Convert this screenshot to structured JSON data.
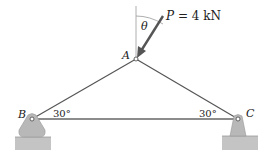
{
  "diagram": {
    "type": "truss",
    "joints": {
      "A": {
        "label": "A",
        "x": 136,
        "y": 59
      },
      "B": {
        "label": "B",
        "x": 32,
        "y": 119
      },
      "C": {
        "label": "C",
        "x": 238,
        "y": 119
      }
    },
    "members": [
      [
        "A",
        "B"
      ],
      [
        "A",
        "C"
      ],
      [
        "B",
        "C"
      ]
    ],
    "angles": {
      "B": "30°",
      "C": "30°",
      "theta": "θ"
    },
    "load": {
      "symbol": "P",
      "equals": " = 4 kN",
      "text": "P = 4 kN"
    },
    "supports": {
      "B": "pin",
      "C": "pin"
    },
    "colors": {
      "member": "#555555",
      "support": "#b8b8b8",
      "ground": "#c0c0c0",
      "arrow": "#555555"
    }
  }
}
